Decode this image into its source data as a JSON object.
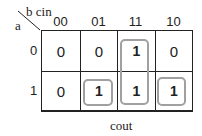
{
  "kmap": {
    "corner": {
      "col_vars": "b cin",
      "row_vars": "a"
    },
    "col_headers": [
      "00",
      "01",
      "11",
      "10"
    ],
    "row_headers": [
      "0",
      "1"
    ],
    "cells": [
      [
        "0",
        "0",
        "1",
        "0"
      ],
      [
        "0",
        "1",
        "1",
        "1"
      ]
    ],
    "groups": [
      {
        "name": "group-col-11",
        "cells": [
          [
            0,
            2
          ],
          [
            1,
            2
          ]
        ]
      },
      {
        "name": "group-r1-c01",
        "cells": [
          [
            1,
            1
          ]
        ]
      },
      {
        "name": "group-r1-c10",
        "cells": [
          [
            1,
            3
          ]
        ]
      }
    ],
    "output_label": "cout",
    "group_color": "#a0a0a0"
  }
}
